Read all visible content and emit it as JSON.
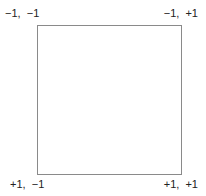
{
  "diagram": {
    "type": "square-corner-labels",
    "corners": {
      "top_left": "−1,  −1",
      "top_right": "−1,  +1",
      "bottom_left": "+1,  −1",
      "bottom_right": "+1,  +1"
    },
    "border_color": "#8a8a8a",
    "background": "#ffffff"
  }
}
